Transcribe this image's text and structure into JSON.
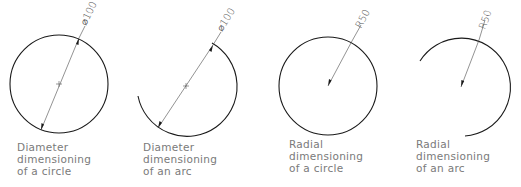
{
  "figures": [
    {
      "id": "diameter-circle",
      "dimension_text": "⌀100",
      "caption": [
        "Diameter",
        "dimensioning",
        "of a circle"
      ]
    },
    {
      "id": "diameter-arc",
      "dimension_text": "⌀100",
      "caption": [
        "Diameter",
        "dimensioning",
        "of an arc"
      ]
    },
    {
      "id": "radial-circle",
      "dimension_text": "R50",
      "caption": [
        "Radial",
        "dimensioning",
        "of a circle"
      ]
    },
    {
      "id": "radial-arc",
      "dimension_text": "R50",
      "caption": [
        "Radial",
        "dimensioning",
        "of an arc"
      ]
    }
  ],
  "colors": {
    "geometry": "#1a1a1a",
    "dimension": "#4a4a4a",
    "caption": "#7a7a7a"
  }
}
